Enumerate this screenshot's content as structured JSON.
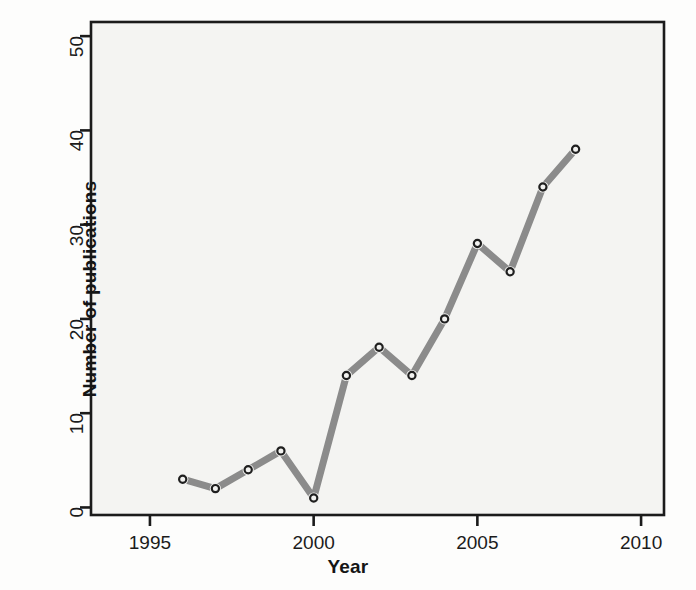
{
  "figure": {
    "background_color": "#fdfdfc",
    "plot_background_color": "#f4f4f2",
    "axis_color": "#1b1b1b",
    "line_color": "#8b8b8b",
    "marker_fill_color": "#f2f2f0",
    "marker_edge_color": "#1f1f1f"
  },
  "chart_data": {
    "type": "line",
    "title": "",
    "xlabel": "Year",
    "ylabel": "Number of publications",
    "x": [
      1996,
      1997,
      1998,
      1999,
      2000,
      2001,
      2002,
      2003,
      2004,
      2005,
      2006,
      2007,
      2008
    ],
    "values": [
      3,
      2,
      4,
      6,
      1,
      14,
      17,
      14,
      20,
      28,
      25,
      34,
      38
    ],
    "series": [
      {
        "name": "Number of publications",
        "values": [
          3,
          2,
          4,
          6,
          1,
          14,
          17,
          14,
          20,
          28,
          25,
          34,
          38
        ]
      }
    ],
    "xlim": [
      1993.2,
      2010.7
    ],
    "ylim": [
      -0.8,
      51.5
    ],
    "xticks": [
      1995,
      2000,
      2005,
      2010
    ],
    "xtick_labels": [
      "1995",
      "2000",
      "2005",
      "2010"
    ],
    "yticks": [
      0,
      10,
      20,
      30,
      40,
      50
    ],
    "ytick_labels": [
      "0",
      "10",
      "20",
      "30",
      "40",
      "50"
    ],
    "grid": false,
    "legend": "none",
    "line_style": "solid-thick-gray",
    "marker": "open-circle"
  }
}
